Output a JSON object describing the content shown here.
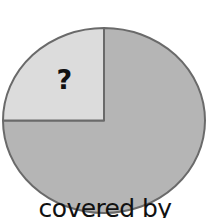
{
  "figure": {
    "title": "",
    "background_color": "#ffffff",
    "width": 210,
    "height": 218
  },
  "labels": {
    "unknown": "?",
    "water_line1": "covered by",
    "water_line2": "water"
  },
  "colors": {
    "water_fill": "#b5b5b5",
    "unknown_fill": "#dcdcdc",
    "outline": "#6a6a6a",
    "text": "#111111",
    "background": "#ffffff"
  },
  "chart_data": {
    "type": "pie",
    "title": "",
    "subtitle": "",
    "xlabel": "",
    "ylabel": "",
    "grid": false,
    "legend_position": "none",
    "center": [
      104,
      120.5
    ],
    "radius_x": 101,
    "radius_y": 92.5,
    "outline_width": 2,
    "start_angle_deg": 90,
    "direction": "counterclockwise",
    "categories": [
      "?",
      "covered by water"
    ],
    "values": [
      25,
      75
    ],
    "value_unit": "percent",
    "slices": [
      {
        "label": "?",
        "value": 25,
        "fraction": 0.25,
        "angle_deg": 90,
        "start_angle_deg": 90,
        "end_angle_deg": 180,
        "color": "#dcdcdc",
        "label_text": "?",
        "label_position": [
          63,
          80
        ]
      },
      {
        "label": "covered by water",
        "value": 75,
        "fraction": 0.75,
        "angle_deg": 270,
        "start_angle_deg": 180,
        "end_angle_deg": 450,
        "color": "#b5b5b5",
        "label_text": "covered by water",
        "label_position": [
          105,
          172
        ]
      }
    ],
    "annotations": [
      {
        "text": "?",
        "x": 63,
        "y": 80
      },
      {
        "text": "covered by",
        "x": 105,
        "y": 160
      },
      {
        "text": "water",
        "x": 105,
        "y": 192
      }
    ]
  }
}
